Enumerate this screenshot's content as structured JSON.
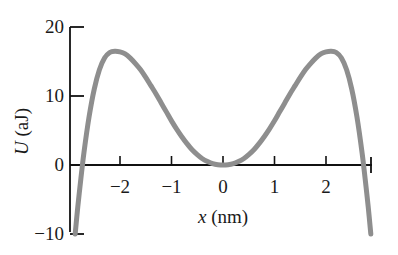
{
  "chart_data": {
    "type": "line",
    "title": "",
    "xlabel": "x (nm)",
    "ylabel": "U (aJ)",
    "xlabel_symbol": "x",
    "xlabel_unit": "(nm)",
    "ylabel_symbol": "U",
    "ylabel_unit": "(aJ)",
    "xlim": [
      -2.9,
      2.9
    ],
    "ylim": [
      -10,
      20
    ],
    "xticks": [
      -2,
      -1,
      0,
      1,
      2
    ],
    "xticklabels": [
      "−2",
      "−1",
      "0",
      "1",
      "2"
    ],
    "yticks": [
      -10,
      0,
      10,
      20
    ],
    "yticklabels": [
      "−10",
      "0",
      "10",
      "20"
    ],
    "grid": false,
    "legend": null,
    "series": [
      {
        "name": "U(x)",
        "color": "#8e8e8e",
        "linewidth": 5,
        "x": [
          -2.87,
          -2.82,
          -2.76,
          -2.7,
          -2.6,
          -2.5,
          -2.4,
          -2.3,
          -2.2,
          -2.1,
          -2.0,
          -1.9,
          -1.8,
          -1.7,
          -1.6,
          -1.5,
          -1.4,
          -1.3,
          -1.2,
          -1.1,
          -1.0,
          -0.9,
          -0.8,
          -0.7,
          -0.6,
          -0.5,
          -0.4,
          -0.3,
          -0.2,
          -0.1,
          0.0,
          0.1,
          0.2,
          0.3,
          0.4,
          0.5,
          0.6,
          0.7,
          0.8,
          0.9,
          1.0,
          1.1,
          1.2,
          1.3,
          1.4,
          1.5,
          1.6,
          1.7,
          1.8,
          1.9,
          2.0,
          2.1,
          2.2,
          2.3,
          2.4,
          2.5,
          2.6,
          2.7,
          2.76,
          2.82,
          2.87
        ],
        "y": [
          -10.0,
          -6.1,
          -2.0,
          1.8,
          7.0,
          11.0,
          13.8,
          15.5,
          16.3,
          16.5,
          16.4,
          16.1,
          15.5,
          14.7,
          13.8,
          12.7,
          11.5,
          10.3,
          9.0,
          7.7,
          6.4,
          5.2,
          4.1,
          3.1,
          2.2,
          1.5,
          0.9,
          0.5,
          0.2,
          0.05,
          0.0,
          0.05,
          0.2,
          0.5,
          0.9,
          1.5,
          2.2,
          3.1,
          4.1,
          5.2,
          6.4,
          7.7,
          9.0,
          10.3,
          11.5,
          12.7,
          13.8,
          14.7,
          15.5,
          16.1,
          16.4,
          16.5,
          16.3,
          15.5,
          13.8,
          11.0,
          7.0,
          1.8,
          -2.0,
          -6.1,
          -10.0
        ],
        "peak_value": 16.5,
        "peak_positions": [
          -2.05,
          2.05
        ],
        "minimum_value": 0,
        "minimum_position": 0,
        "zero_crossings": [
          -2.73,
          0.0,
          2.73
        ]
      }
    ]
  },
  "axes": {
    "x_axis_name": "x-axis",
    "y_axis_name": "y-axis"
  }
}
